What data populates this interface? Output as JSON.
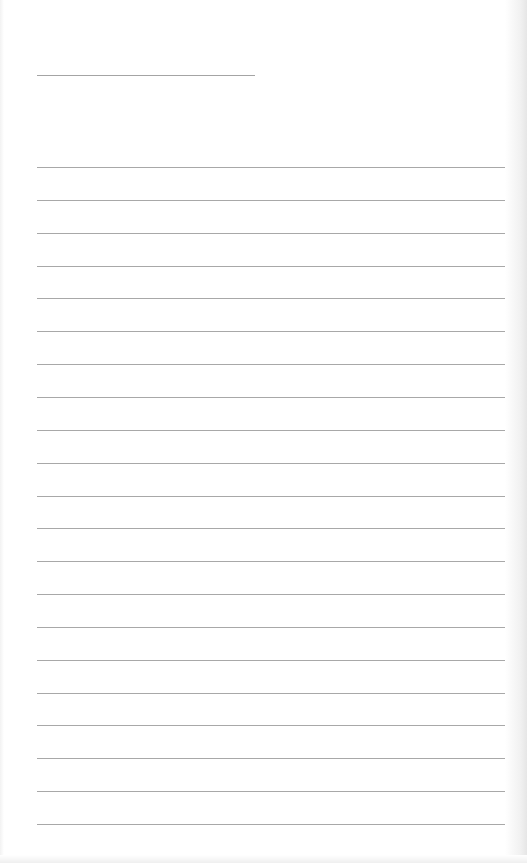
{
  "page": {
    "type": "blank lined notepaper",
    "background_color": "#ffffff",
    "line_color": "#a8a8a8"
  },
  "title_line": {
    "x": 37,
    "y": 75,
    "width": 218
  },
  "ruled_lines": {
    "count": 21,
    "start_y": 167,
    "spacing": 32.85,
    "x": 37,
    "width": 468
  }
}
